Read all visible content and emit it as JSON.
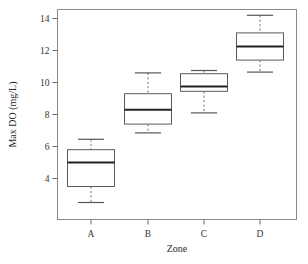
{
  "chart_data": {
    "type": "box",
    "title": "",
    "xlabel": "Zone",
    "ylabel": "Max DO (mg/L)",
    "categories": [
      "A",
      "B",
      "C",
      "D"
    ],
    "ytick_labels": [
      "4",
      "6",
      "8",
      "10",
      "12",
      "14"
    ],
    "ytick_values": [
      4,
      6,
      8,
      10,
      12,
      14
    ],
    "ylim": [
      2.0,
      14.7
    ],
    "grid": false,
    "legend": "none",
    "boxes": [
      {
        "category": "A",
        "whisker_low": 2.5,
        "q1": 3.5,
        "median": 5.0,
        "q3": 5.8,
        "whisker_high": 6.45
      },
      {
        "category": "B",
        "whisker_low": 6.85,
        "q1": 7.4,
        "median": 8.3,
        "q3": 9.3,
        "whisker_high": 10.6
      },
      {
        "category": "C",
        "whisker_low": 8.1,
        "q1": 9.45,
        "median": 9.75,
        "q3": 10.55,
        "whisker_high": 10.75
      },
      {
        "category": "D",
        "whisker_low": 10.65,
        "q1": 11.4,
        "median": 12.25,
        "q3": 13.1,
        "whisker_high": 14.2
      }
    ],
    "colors": {
      "frame": "#8a8a8a",
      "box_stroke": "#5a5a5a",
      "box_fill": "#ffffff",
      "median": "#222222",
      "whisker": "#777777",
      "text": "#2b2b2b",
      "background": "#ffffff"
    }
  },
  "axes": {
    "y_title": "Max DO (mg/L)",
    "x_title": "Zone"
  }
}
